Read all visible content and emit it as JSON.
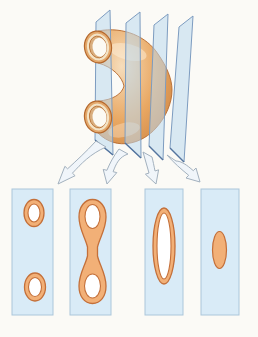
{
  "figure": {
    "name": "serial-sections-of-curved-tube",
    "planes_count": 4,
    "arrows_count": 4,
    "sections": [
      {
        "index": 1,
        "shape": "two-separate-rings"
      },
      {
        "index": 2,
        "shape": "dumbbell-two-rings-joined-by-neck"
      },
      {
        "index": 3,
        "shape": "elongated-hollow-oval"
      },
      {
        "index": 4,
        "shape": "small-solid-oval"
      }
    ]
  },
  "colors": {
    "background": "#FBFAF6",
    "plane_fill": "#BCD9EE",
    "plane_stroke": "#7D9CC0",
    "plane_bottom_edge": "#54749E",
    "panel_fill": "#D9EBF7",
    "panel_stroke": "#ABC6DA",
    "section_fill": "#F2B077",
    "section_stroke": "#C4703A",
    "section_hole": "#FFFFFF",
    "tube_highlight": "#F6DDBC",
    "tube_mid": "#E9A863",
    "tube_dark": "#C97E3C",
    "tube_outline": "#B5682C",
    "ring_wall": "#E3A86C",
    "ring_rim_face": "#F3E4C7",
    "ring_inner_wall": "#D9AE7E",
    "ring_hole": "#FCFAF4",
    "arrow_fill": "#F0F5FA",
    "arrow_stroke": "#A3B1BE"
  }
}
